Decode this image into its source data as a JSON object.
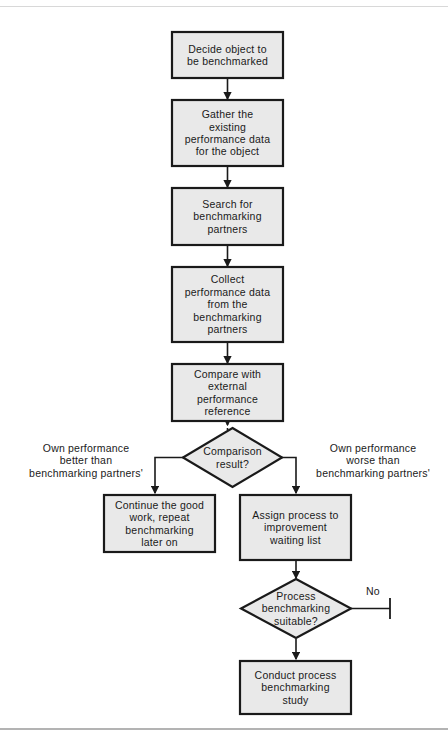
{
  "diagram": {
    "colors": {
      "node_fill": "#e9e9e9",
      "node_stroke": "#1a1a1a",
      "connector": "#1a1a1a",
      "page_background": "#ffffff",
      "frame_rule": "#9a9a9a",
      "text": "#1a1a1a"
    },
    "nodes": [
      {
        "id": "n1",
        "shape": "process",
        "label": "Decide object to\nbe benchmarked"
      },
      {
        "id": "n2",
        "shape": "process",
        "label": "Gather the\nexisting\nperformance data\nfor the object"
      },
      {
        "id": "n3",
        "shape": "process",
        "label": "Search for\nbenchmarking\npartners"
      },
      {
        "id": "n4",
        "shape": "process",
        "label": "Collect\nperformance data\nfrom the\nbenchmarking\npartners"
      },
      {
        "id": "n5",
        "shape": "process",
        "label": "Compare with\nexternal\nperformance\nreference"
      },
      {
        "id": "d1",
        "shape": "decision",
        "label": "Comparison\nresult?"
      },
      {
        "id": "n6",
        "shape": "process",
        "label": "Continue the good\nwork, repeat\nbenchmarking\nlater on"
      },
      {
        "id": "n7",
        "shape": "process",
        "label": "Assign process to\nimprovement\nwaiting list"
      },
      {
        "id": "d2",
        "shape": "decision",
        "label": "Process\nbenchmarking\nsuitable?"
      },
      {
        "id": "n8",
        "shape": "process",
        "label": "Conduct process\nbenchmarking\nstudy"
      }
    ],
    "branch_labels": {
      "left": "Own performance\nbetter than\nbenchmarking partners'",
      "right": "Own performance\nworse than\nbenchmarking partners'"
    },
    "edge_labels": {
      "no": "No"
    },
    "terminators": [
      {
        "id": "t1",
        "for_edge": "no",
        "shape": "stop-bar"
      }
    ]
  }
}
